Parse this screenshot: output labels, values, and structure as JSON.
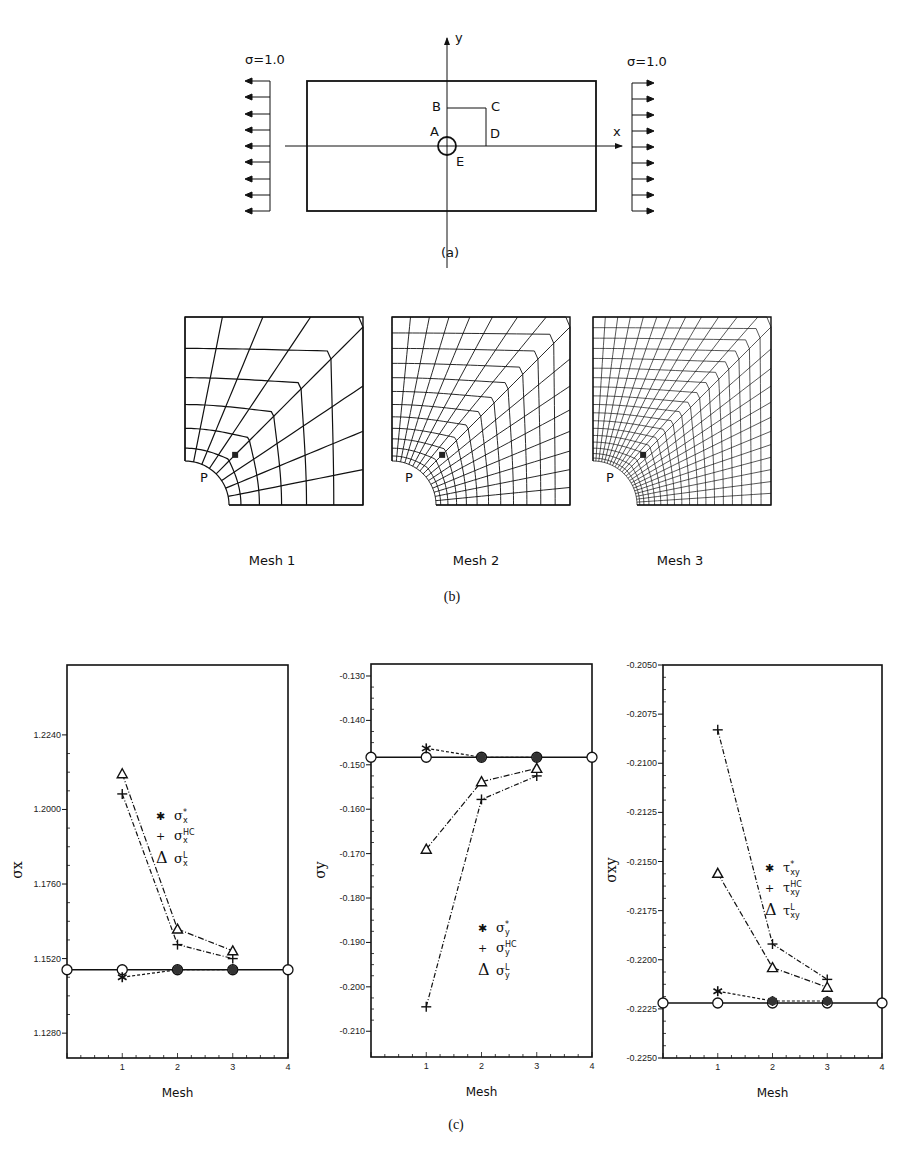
{
  "figure": {
    "part_a": {
      "caption": "(a)",
      "load_left": "σ=1.0",
      "load_right": "σ=1.0",
      "axis_x": "x",
      "axis_y": "y",
      "points": {
        "A": "A",
        "B": "B",
        "C": "C",
        "D": "D",
        "E": "E"
      }
    },
    "part_b": {
      "caption": "(b)",
      "meshes": [
        {
          "label": "Mesh 1",
          "point": "P",
          "density": 1
        },
        {
          "label": "Mesh 2",
          "point": "P",
          "density": 2
        },
        {
          "label": "Mesh 3",
          "point": "P",
          "density": 3
        }
      ]
    },
    "part_c": {
      "caption": "(c)"
    }
  },
  "chart_data": [
    {
      "type": "line",
      "title": "",
      "xlabel": "Mesh",
      "ylabel": "σx",
      "x": [
        1,
        2,
        3
      ],
      "xticks": [
        "1",
        "2",
        "3",
        "4"
      ],
      "xlim": [
        0,
        4
      ],
      "ylim": [
        1.12,
        1.244
      ],
      "yticks": [
        "1.2240",
        "1.2000",
        "1.1760",
        "1.1520",
        "1.1280"
      ],
      "reference_line": 1.1484,
      "series": [
        {
          "name": "σx*",
          "marker": "*",
          "values": [
            1.146,
            1.1484,
            1.1484
          ]
        },
        {
          "name": "σxHC",
          "marker": "+",
          "values": [
            1.205,
            1.1565,
            1.152
          ]
        },
        {
          "name": "σxL",
          "marker": "triangle",
          "values": [
            1.2115,
            1.1615,
            1.1545
          ]
        }
      ],
      "legend": [
        {
          "sym": "✱",
          "base": "σ",
          "sup": "*",
          "sub": "x"
        },
        {
          "sym": "+",
          "base": "σ",
          "sup": "HC",
          "sub": "x"
        },
        {
          "sym": "Δ",
          "base": "σ",
          "sup": "L",
          "sub": "x"
        }
      ]
    },
    {
      "type": "line",
      "title": "",
      "xlabel": "Mesh",
      "ylabel": "σy",
      "x": [
        1,
        2,
        3
      ],
      "xticks": [
        "1",
        "2",
        "3",
        "4"
      ],
      "xlim": [
        0,
        4
      ],
      "ylim": [
        -0.2155,
        -0.1277
      ],
      "yticks": [
        "-0.130",
        "-0.140",
        "-0.150",
        "-0.160",
        "-0.170",
        "-0.180",
        "-0.190",
        "-0.200",
        "-0.210"
      ],
      "reference_line": -0.1483,
      "series": [
        {
          "name": "σy*",
          "marker": "*",
          "values": [
            -0.1463,
            -0.1483,
            -0.1483
          ]
        },
        {
          "name": "σyHC",
          "marker": "+",
          "values": [
            -0.2045,
            -0.1578,
            -0.1525
          ]
        },
        {
          "name": "σyL",
          "marker": "triangle",
          "values": [
            -0.169,
            -0.1538,
            -0.1508
          ]
        }
      ],
      "legend": [
        {
          "sym": "✱",
          "base": "σ",
          "sup": "*",
          "sub": "y"
        },
        {
          "sym": "+",
          "base": "σ",
          "sup": "HC",
          "sub": "y"
        },
        {
          "sym": "Δ",
          "base": "σ",
          "sup": "L",
          "sub": "y"
        }
      ]
    },
    {
      "type": "line",
      "title": "",
      "xlabel": "Mesh",
      "ylabel": "σxy",
      "x": [
        1,
        2,
        3
      ],
      "xticks": [
        "1",
        "2",
        "3",
        "4"
      ],
      "xlim": [
        0,
        4
      ],
      "ylim": [
        -0.225,
        -0.205
      ],
      "yticks": [
        "-0.2050",
        "-0.2075",
        "-0.2100",
        "-0.2125",
        "-0.2150",
        "-0.2175",
        "-0.2200",
        "-0.2225",
        "-0.2250"
      ],
      "reference_line": -0.2222,
      "series": [
        {
          "name": "τxy*",
          "marker": "*",
          "values": [
            -0.2216,
            -0.2221,
            -0.2221
          ]
        },
        {
          "name": "τxyHC",
          "marker": "+",
          "values": [
            -0.2083,
            -0.2192,
            -0.221
          ]
        },
        {
          "name": "τxyL",
          "marker": "triangle",
          "values": [
            -0.2156,
            -0.2204,
            -0.2214
          ]
        }
      ],
      "legend": [
        {
          "sym": "✱",
          "base": "τ",
          "sup": "*",
          "sub": "xy"
        },
        {
          "sym": "+",
          "base": "τ",
          "sup": "HC",
          "sub": "xy"
        },
        {
          "sym": "Δ",
          "base": "τ",
          "sup": "L",
          "sub": "xy"
        }
      ]
    }
  ]
}
